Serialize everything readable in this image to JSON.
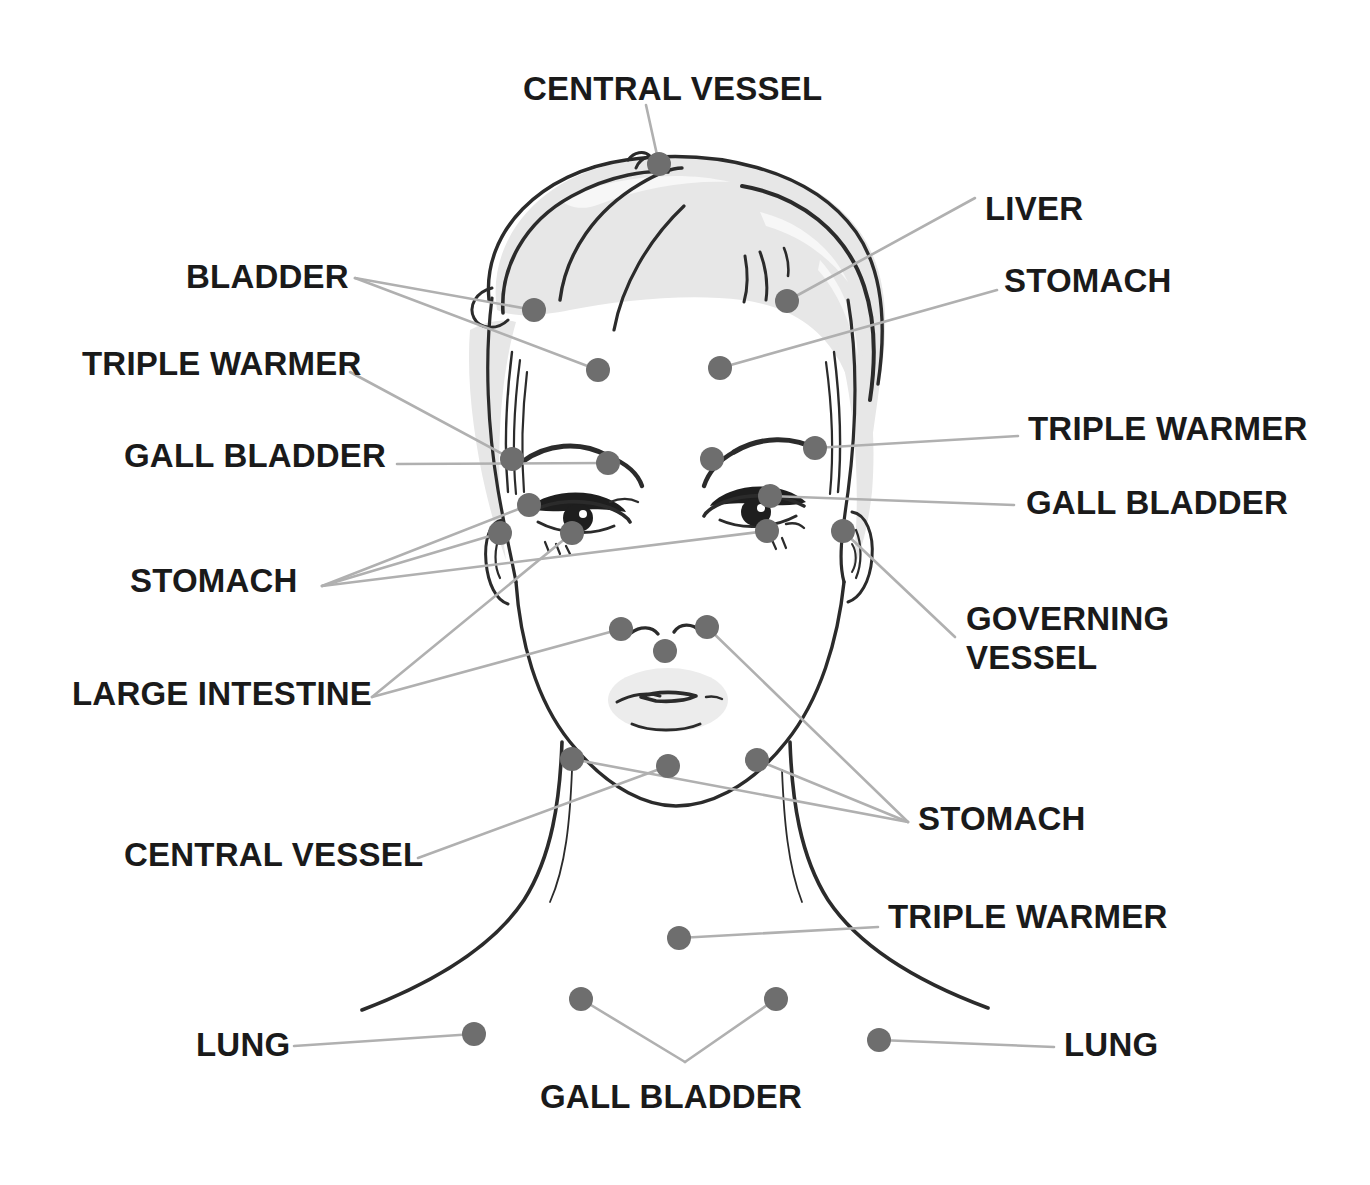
{
  "diagram": {
    "colors": {
      "leader_line": "#b0b0b0",
      "point_dot": "#6e6e6e",
      "ink": "#2b2b2b",
      "hair_shade": "#e7e7e7",
      "label_text": "#1a1a1a",
      "background": "#ffffff"
    }
  },
  "labels": [
    {
      "id": "central-vessel-top",
      "text": "CENTRAL VESSEL",
      "x": 523,
      "y": 70,
      "align": "left"
    },
    {
      "id": "liver",
      "text": "LIVER",
      "x": 985,
      "y": 190,
      "align": "left"
    },
    {
      "id": "bladder",
      "text": "BLADDER",
      "x": 186,
      "y": 258,
      "align": "left"
    },
    {
      "id": "stomach-upper-right",
      "text": "STOMACH",
      "x": 1004,
      "y": 262,
      "align": "left"
    },
    {
      "id": "triple-warmer-left",
      "text": "TRIPLE WARMER",
      "x": 82,
      "y": 345,
      "align": "left"
    },
    {
      "id": "triple-warmer-right",
      "text": "TRIPLE WARMER",
      "x": 1028,
      "y": 410,
      "align": "left"
    },
    {
      "id": "gall-bladder-left",
      "text": "GALL BLADDER",
      "x": 124,
      "y": 437,
      "align": "left"
    },
    {
      "id": "gall-bladder-right",
      "text": "GALL BLADDER",
      "x": 1026,
      "y": 484,
      "align": "left"
    },
    {
      "id": "stomach-left",
      "text": "STOMACH",
      "x": 130,
      "y": 562,
      "align": "left"
    },
    {
      "id": "governing-vessel",
      "text": "GOVERNING VESSEL",
      "x": 966,
      "y": 600,
      "align": "left",
      "multiline": true
    },
    {
      "id": "large-intestine",
      "text": "LARGE INTESTINE",
      "x": 72,
      "y": 675,
      "align": "left"
    },
    {
      "id": "stomach-lower-right",
      "text": "STOMACH",
      "x": 918,
      "y": 800,
      "align": "left"
    },
    {
      "id": "central-vessel-neck",
      "text": "CENTRAL VESSEL",
      "x": 124,
      "y": 836,
      "align": "left"
    },
    {
      "id": "triple-warmer-chest",
      "text": "TRIPLE WARMER",
      "x": 888,
      "y": 898,
      "align": "left"
    },
    {
      "id": "lung-left",
      "text": "LUNG",
      "x": 196,
      "y": 1026,
      "align": "left"
    },
    {
      "id": "lung-right",
      "text": "LUNG",
      "x": 1064,
      "y": 1026,
      "align": "left"
    },
    {
      "id": "gall-bladder-bottom",
      "text": "GALL BLADDER",
      "x": 540,
      "y": 1078,
      "align": "left"
    }
  ],
  "points": [
    {
      "id": "cv-crown",
      "organ": "CENTRAL VESSEL",
      "x": 659,
      "y": 164
    },
    {
      "id": "bladder-l",
      "organ": "BLADDER",
      "x": 534,
      "y": 310
    },
    {
      "id": "liver-r",
      "organ": "LIVER",
      "x": 787,
      "y": 301
    },
    {
      "id": "forehead-l",
      "organ": "BLADDER",
      "x": 598,
      "y": 370
    },
    {
      "id": "forehead-r",
      "organ": "STOMACH",
      "x": 720,
      "y": 368
    },
    {
      "id": "brow-outer-l",
      "organ": "TRIPLE WARMER",
      "x": 512,
      "y": 459
    },
    {
      "id": "brow-inner-l",
      "organ": "GALL BLADDER",
      "x": 608,
      "y": 463
    },
    {
      "id": "glabella",
      "organ": "STOMACH",
      "x": 712,
      "y": 459
    },
    {
      "id": "brow-inner-r",
      "organ": "TRIPLE WARMER",
      "x": 815,
      "y": 448
    },
    {
      "id": "eye-outer-l",
      "organ": "STOMACH",
      "x": 529,
      "y": 505
    },
    {
      "id": "eye-outer-r",
      "organ": "GALL BLADDER",
      "x": 770,
      "y": 496
    },
    {
      "id": "temple-l",
      "organ": "STOMACH",
      "x": 500,
      "y": 533
    },
    {
      "id": "undereye-l",
      "organ": "LARGE INTESTINE",
      "x": 572,
      "y": 533
    },
    {
      "id": "undereye-r",
      "organ": "STOMACH",
      "x": 767,
      "y": 531
    },
    {
      "id": "temple-r",
      "organ": "GOVERNING VESSEL",
      "x": 843,
      "y": 531
    },
    {
      "id": "nose-side-l",
      "organ": "LARGE INTESTINE",
      "x": 621,
      "y": 629
    },
    {
      "id": "nose-side-r",
      "organ": "STOMACH",
      "x": 707,
      "y": 627
    },
    {
      "id": "philtrum",
      "organ": "GOVERNING VESSEL",
      "x": 665,
      "y": 651
    },
    {
      "id": "jaw-l",
      "organ": "CENTRAL VESSEL",
      "x": 572,
      "y": 759
    },
    {
      "id": "chin",
      "organ": "CENTRAL VESSEL",
      "x": 668,
      "y": 766
    },
    {
      "id": "jaw-r",
      "organ": "STOMACH",
      "x": 757,
      "y": 760
    },
    {
      "id": "chest-center",
      "organ": "TRIPLE WARMER",
      "x": 679,
      "y": 938
    },
    {
      "id": "clavicle-l",
      "organ": "GALL BLADDER",
      "x": 581,
      "y": 999
    },
    {
      "id": "clavicle-r",
      "organ": "GALL BLADDER",
      "x": 776,
      "y": 999
    },
    {
      "id": "shoulder-l",
      "organ": "LUNG",
      "x": 474,
      "y": 1034
    },
    {
      "id": "shoulder-r",
      "organ": "LUNG",
      "x": 879,
      "y": 1040
    }
  ],
  "leader_lines": [
    {
      "id": "ll-cv-crown",
      "from_label": "central-vessel-top",
      "points": "646,105 659,164"
    },
    {
      "id": "ll-liver",
      "from_label": "liver",
      "points": "975,198 787,301"
    },
    {
      "id": "ll-bladder-a",
      "from_label": "bladder",
      "points": "355,278 534,310"
    },
    {
      "id": "ll-bladder-b",
      "from_label": "bladder",
      "points": "355,278 598,370"
    },
    {
      "id": "ll-stomach-up-right",
      "from_label": "stomach-upper-right",
      "points": "997,290 720,368"
    },
    {
      "id": "ll-triple-warmer-l",
      "from_label": "triple-warmer-left",
      "points": "350,372 512,459"
    },
    {
      "id": "ll-triple-warmer-r",
      "from_label": "triple-warmer-right",
      "points": "1018,436 815,448"
    },
    {
      "id": "ll-gall-bladder-l",
      "from_label": "gall-bladder-left",
      "points": "397,464 608,463"
    },
    {
      "id": "ll-gall-bladder-r",
      "from_label": "gall-bladder-right",
      "points": "1014,505 770,496"
    },
    {
      "id": "ll-stomach-l-a",
      "from_label": "stomach-left",
      "points": "322,586 529,505"
    },
    {
      "id": "ll-stomach-l-b",
      "from_label": "stomach-left",
      "points": "322,586 500,533"
    },
    {
      "id": "ll-stomach-l-c",
      "from_label": "stomach-left",
      "points": "322,586 767,531"
    },
    {
      "id": "ll-governing-vessel",
      "from_label": "governing-vessel",
      "points": "955,637 843,531"
    },
    {
      "id": "ll-large-intestine-a",
      "from_label": "large-intestine",
      "points": "372,697 572,533"
    },
    {
      "id": "ll-large-intestine-b",
      "from_label": "large-intestine",
      "points": "372,697 621,629"
    },
    {
      "id": "ll-stomach-lr-a",
      "from_label": "stomach-lower-right",
      "points": "908,822 707,627"
    },
    {
      "id": "ll-stomach-lr-b",
      "from_label": "stomach-lower-right",
      "points": "908,822 757,760"
    },
    {
      "id": "ll-stomach-lr-c",
      "from_label": "stomach-lower-right",
      "points": "908,822 572,759"
    },
    {
      "id": "ll-central-vessel-neck",
      "from_label": "central-vessel-neck",
      "points": "418,858 668,766"
    },
    {
      "id": "ll-triple-warmer-chest",
      "from_label": "triple-warmer-chest",
      "points": "878,927 679,938"
    },
    {
      "id": "ll-lung-left",
      "from_label": "lung-left",
      "points": "294,1046 474,1034"
    },
    {
      "id": "ll-lung-right",
      "from_label": "lung-right",
      "points": "1054,1047 879,1040"
    },
    {
      "id": "ll-gall-bladder-b-a",
      "from_label": "gall-bladder-bottom",
      "points": "685,1062 581,999"
    },
    {
      "id": "ll-gall-bladder-b-b",
      "from_label": "gall-bladder-bottom",
      "points": "685,1062 776,999"
    }
  ]
}
